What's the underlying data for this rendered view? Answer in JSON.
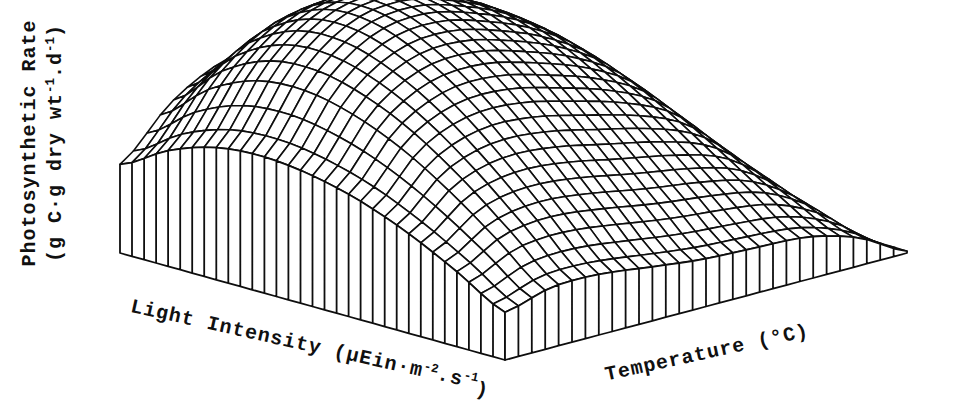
{
  "figure": {
    "background": "#ffffff",
    "ink_color": "#0e0e0e"
  },
  "labels": {
    "z_axis": {
      "line1": "Photosynthetic Rate",
      "line2_segments": [
        {
          "t": "(g C·g dry wt"
        },
        {
          "t": "-1",
          "sup": true
        },
        {
          "t": ".d"
        },
        {
          "t": "-1",
          "sup": true
        },
        {
          "t": ")"
        }
      ]
    },
    "light_axis_segments": [
      {
        "t": "Light Intensity (μEin·m"
      },
      {
        "t": "-2",
        "sup": true
      },
      {
        "t": "."
      },
      {
        "t": "s"
      },
      {
        "t": "-1",
        "sup": true
      },
      {
        "t": ")",
        "sub": true
      }
    ],
    "temp_axis": "Temperature (°C)"
  },
  "chart_data": {
    "type": "surface",
    "title": "",
    "xlabel": "Temperature (°C)",
    "ylabel": "Light Intensity (μEin·m⁻².s⁻¹)",
    "zlabel": "Photosynthetic Rate (g C·g dry wt⁻¹.d⁻¹)",
    "ticks": "none — axes are unlabeled in the figure (wireframe mesh only)",
    "legend": "none",
    "grid": {
      "light_cells": 32,
      "temp_cells": 30
    },
    "z_normalized": {
      "model": "z(a,b) = light_profile(a) * temp_profile(b) * (1 - edge_correction*(1-a)^2*sin(pi*b)); a = position along light axis (0 at front corner), b = position along temperature axis (0 at front corner); profiles interpolated with Catmull-Rom; z clamped >= 0",
      "light_profile": [
        0.35,
        0.55,
        0.73,
        0.87,
        0.96,
        1.0,
        0.97,
        0.85,
        0.65
      ],
      "temp_profile": [
        0.52,
        0.8,
        0.96,
        1.0,
        0.95,
        0.85,
        0.68,
        0.38,
        0.02
      ],
      "edge_correction": 0.45,
      "shape_summary": "Rate rises with light then saturates and slightly declines (photoinhibition); rate has a mid-range temperature optimum and falls to ~0 at the highest temperature, where the surface tapers to a point at the right corner."
    },
    "projection": {
      "front_corner": [
        505,
        360
      ],
      "left_corner": [
        120,
        253
      ],
      "right_corner": [
        907,
        253
      ],
      "height_px": 262
    },
    "style": {
      "fill": "#ffffff",
      "mesh_stroke_px": 1.6,
      "skirt_stroke_px": 1.8
    }
  }
}
